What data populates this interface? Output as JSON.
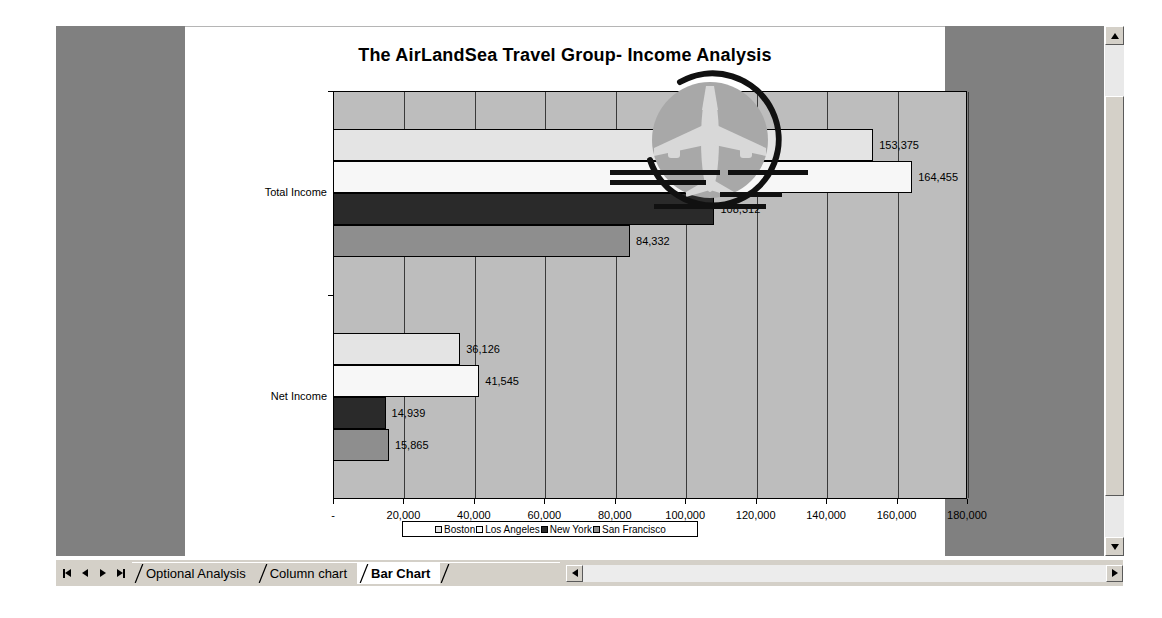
{
  "window": {
    "sheet_background": "#ffffff",
    "outside_background": "#808080"
  },
  "chart_data": {
    "type": "bar",
    "orientation": "horizontal",
    "title": "The AirLandSea Travel Group- Income Analysis",
    "xlabel": "",
    "ylabel": "",
    "categories": [
      "Total Income",
      "Net Income"
    ],
    "series": [
      {
        "name": "Boston",
        "color": "#e4e4e4",
        "values": [
          153375,
          36126
        ]
      },
      {
        "name": "Los Angeles",
        "color": "#f7f7f7",
        "values": [
          164455,
          41545
        ]
      },
      {
        "name": "New York",
        "color": "#2a2a2a",
        "values": [
          108312,
          14939
        ]
      },
      {
        "name": "San Francisco",
        "color": "#8e8e8e",
        "values": [
          84332,
          15865
        ]
      }
    ],
    "data_labels": {
      "Net Income": [
        "36,126",
        "41,545",
        "14,939",
        "15,865"
      ],
      "Total Income": [
        "153,375",
        "164,455",
        "108,312",
        "84,332"
      ]
    },
    "xlim": [
      0,
      180000
    ],
    "xticks": [
      0,
      20000,
      40000,
      60000,
      80000,
      100000,
      120000,
      140000,
      160000,
      180000
    ],
    "xtick_labels": [
      "-",
      "20,000",
      "40,000",
      "60,000",
      "80,000",
      "100,000",
      "120,000",
      "140,000",
      "160,000",
      "180,000"
    ],
    "grid": true,
    "legend_position": "bottom",
    "plot_background": "#bdbdbd"
  },
  "legend": {
    "entries": [
      {
        "label": "Boston"
      },
      {
        "label": "Los Angeles"
      },
      {
        "label": "New York"
      },
      {
        "label": "San Francisco"
      }
    ]
  },
  "watermark": {
    "name": "airplane-logo-watermark"
  },
  "tabbar": {
    "nav": {
      "first": "|◀",
      "prev": "◀",
      "next": "▶",
      "last": "▶|"
    },
    "tabs": [
      {
        "label": "Optional Analysis",
        "active": false
      },
      {
        "label": "Column chart",
        "active": false
      },
      {
        "label": "Bar Chart",
        "active": true
      }
    ]
  },
  "scrollbars": {
    "vertical": {
      "up": "▲",
      "down": "▼"
    },
    "horizontal": {
      "left": "◀",
      "right": "▶"
    }
  }
}
